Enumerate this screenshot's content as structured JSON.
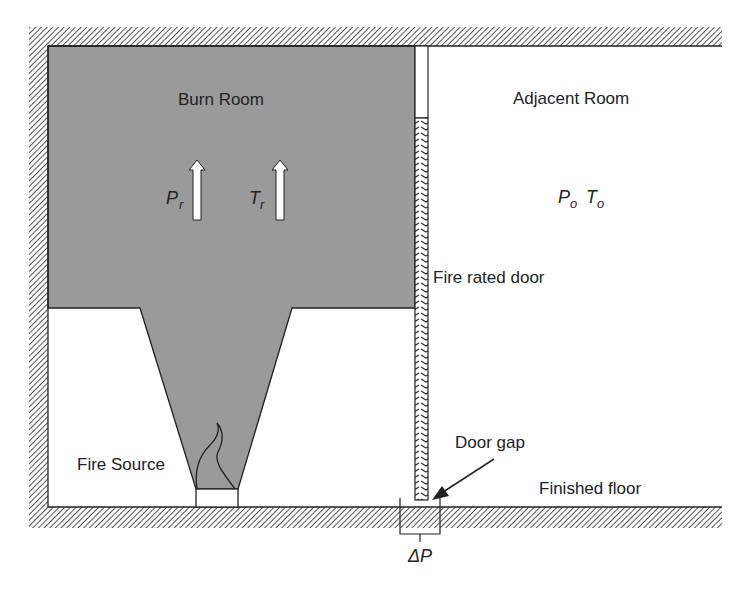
{
  "diagram": {
    "type": "fire-compartment-cross-section",
    "labels": {
      "burn_room": "Burn Room",
      "adjacent_room": "Adjacent Room",
      "fire_rated_door": "Fire rated door",
      "fire_source": "Fire Source",
      "door_gap": "Door gap",
      "finished_floor": "Finished floor"
    },
    "symbols": {
      "burn_pressure_main": "P",
      "burn_pressure_sub": "r",
      "burn_temp_main": "T",
      "burn_temp_sub": "r",
      "adj_pressure_main": "P",
      "adj_pressure_sub": "o",
      "adj_temp_main": "T",
      "adj_temp_sub": "o",
      "delta_p": "ΔP"
    },
    "colors": {
      "smoke": "#9a9a9a",
      "wall_hatch": "#555555",
      "line": "#222222",
      "background": "#ffffff"
    }
  }
}
